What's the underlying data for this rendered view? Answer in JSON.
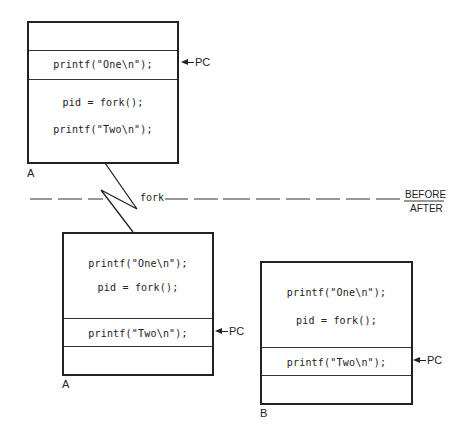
{
  "diagram": {
    "divider": {
      "fork_label": "fork",
      "before_label": "BEFORE",
      "after_label": "AFTER"
    },
    "before": {
      "process_label": "A",
      "pc_label": "PC",
      "lines": [
        "printf(\"One\\n\");",
        "pid = fork();",
        "printf(\"Two\\n\");"
      ]
    },
    "after": [
      {
        "process_label": "A",
        "pc_label": "PC",
        "lines": [
          "printf(\"One\\n\");",
          "pid = fork();",
          "printf(\"Two\\n\");"
        ]
      },
      {
        "process_label": "B",
        "pc_label": "PC",
        "lines": [
          "printf(\"One\\n\");",
          "pid = fork();",
          "printf(\"Two\\n\");"
        ]
      }
    ]
  }
}
